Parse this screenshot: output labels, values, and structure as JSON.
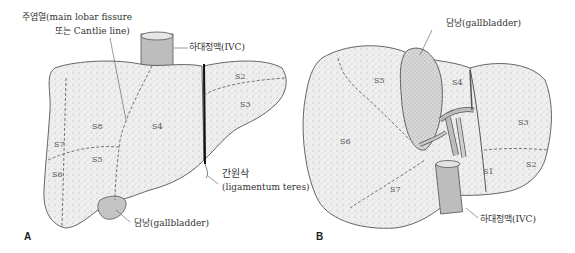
{
  "panel_a": {
    "letter": "A",
    "labels": {
      "fissure_line1": "주엽열(main lobar fissure",
      "fissure_line2": "또는 Cantlie line)",
      "ivc": "하대정맥(IVC)",
      "ligament_line1": "간원삭",
      "ligament_line2": "(ligamentum teres)",
      "gallbladder": "담낭(gallbladder)"
    },
    "segments": [
      "S8",
      "S4",
      "S7",
      "S5",
      "S6",
      "S2",
      "S3"
    ]
  },
  "panel_b": {
    "letter": "B",
    "labels": {
      "gallbladder": "담낭(gallbladder)",
      "ivc": "하대정맥(IVC)"
    },
    "segments": [
      "S5",
      "S4",
      "S6",
      "S3",
      "S2",
      "S1",
      "S7"
    ]
  },
  "colors": {
    "liver_fill": "#ececec",
    "outline": "#555555",
    "vessel_fill": "#b5b5b5",
    "gallbladder_fill": "#c4c4c4"
  }
}
